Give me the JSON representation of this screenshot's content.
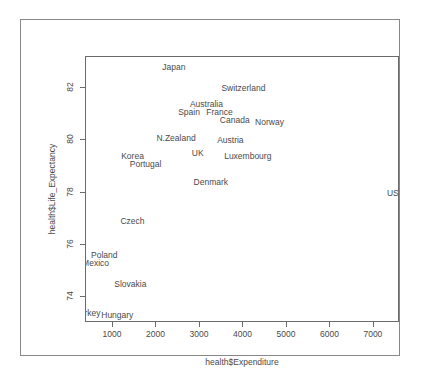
{
  "top_strip": {
    "text": "· · · · · · · · · ·"
  },
  "chart_data": {
    "type": "scatter",
    "title": "",
    "xlabel": "health$Expenditure",
    "ylabel": "health$Life_Expectancy",
    "xlim": [
      380,
      7600
    ],
    "ylim": [
      73.0,
      83.2
    ],
    "xticks": [
      1000,
      2000,
      3000,
      4000,
      5000,
      6000,
      7000
    ],
    "yticks": [
      74,
      76,
      78,
      80,
      82
    ],
    "grid": false,
    "legend": null,
    "marker": "text-label",
    "labels": [
      {
        "name": "Japan",
        "x": 2400,
        "y": 82.8
      },
      {
        "name": "Switzerland",
        "x": 4000,
        "y": 82.0
      },
      {
        "name": "Australia",
        "x": 3150,
        "y": 81.4
      },
      {
        "name": "Spain",
        "x": 2750,
        "y": 81.1
      },
      {
        "name": "France",
        "x": 3450,
        "y": 81.1
      },
      {
        "name": "Canada",
        "x": 3800,
        "y": 80.8
      },
      {
        "name": "Norway",
        "x": 4600,
        "y": 80.7
      },
      {
        "name": "N.Zealand",
        "x": 2450,
        "y": 80.1
      },
      {
        "name": "Austria",
        "x": 3700,
        "y": 80.0
      },
      {
        "name": "Korea",
        "x": 1450,
        "y": 79.4
      },
      {
        "name": "UK",
        "x": 2950,
        "y": 79.5
      },
      {
        "name": "Luxembourg",
        "x": 4100,
        "y": 79.4
      },
      {
        "name": "Portugal",
        "x": 1750,
        "y": 79.1
      },
      {
        "name": "Denmark",
        "x": 3250,
        "y": 78.4
      },
      {
        "name": "USA",
        "x": 7500,
        "y": 78.0
      },
      {
        "name": "Czech",
        "x": 1450,
        "y": 76.9
      },
      {
        "name": "Poland",
        "x": 800,
        "y": 75.6
      },
      {
        "name": "Mexico",
        "x": 600,
        "y": 75.3
      },
      {
        "name": "Slovakia",
        "x": 1400,
        "y": 74.5
      },
      {
        "name": "Turkey",
        "x": 420,
        "y": 73.4
      },
      {
        "name": "Hungary",
        "x": 1100,
        "y": 73.3
      }
    ]
  }
}
